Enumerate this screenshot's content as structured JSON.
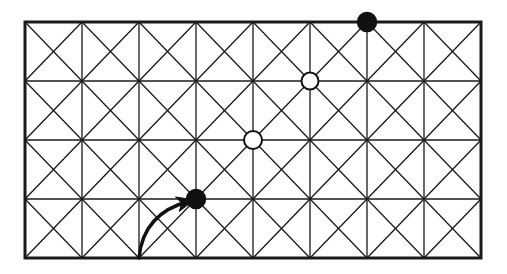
{
  "figure": {
    "background_color": "#ffffff",
    "line_color": "#1a1a1a"
  },
  "chart_data": {
    "type": "diagram",
    "title": "",
    "subtitle": "",
    "xlabel": "",
    "ylabel": "",
    "grid": {
      "columns": 8,
      "rows": 4,
      "x_left": 25,
      "x_right": 481,
      "y_top": 22,
      "y_bottom": 258,
      "cell_width": 57,
      "cell_height": 59,
      "x_positions": [
        25,
        82,
        139,
        196,
        253,
        310,
        367,
        424,
        481
      ],
      "y_positions": [
        22,
        81,
        140,
        199,
        258
      ],
      "diagonals": "both",
      "border_width": 3,
      "interior_line_width": 1.3,
      "diagonal_line_width": 1.3
    },
    "vertices": [
      {
        "id": "black-vertex-top",
        "style": "filled",
        "fill": "#111111",
        "stroke": "#111111",
        "x": 367,
        "y": 22,
        "radius": 9.5,
        "grid_col": 6,
        "grid_row": 0
      },
      {
        "id": "white-vertex-upper",
        "style": "open",
        "fill": "#ffffff",
        "stroke": "#111111",
        "x": 310,
        "y": 81,
        "radius": 8.5,
        "grid_col": 5,
        "grid_row": 1
      },
      {
        "id": "white-vertex-lower",
        "style": "open",
        "fill": "#ffffff",
        "stroke": "#111111",
        "x": 253,
        "y": 140,
        "radius": 9,
        "grid_col": 4,
        "grid_row": 2
      },
      {
        "id": "black-vertex-bottom",
        "style": "filled",
        "fill": "#111111",
        "stroke": "#111111",
        "x": 196,
        "y": 199,
        "radius": 9.5,
        "grid_col": 3,
        "grid_row": 3
      }
    ],
    "arrow": {
      "id": "transition-arrow",
      "from_x": 139,
      "from_y": 258,
      "to_x": 190,
      "to_y": 201,
      "control_x": 143,
      "control_y": 213,
      "stroke": "#111111",
      "stroke_width": 3.4,
      "head_length": 17,
      "head_width": 15
    },
    "legend": [],
    "annotations": []
  }
}
